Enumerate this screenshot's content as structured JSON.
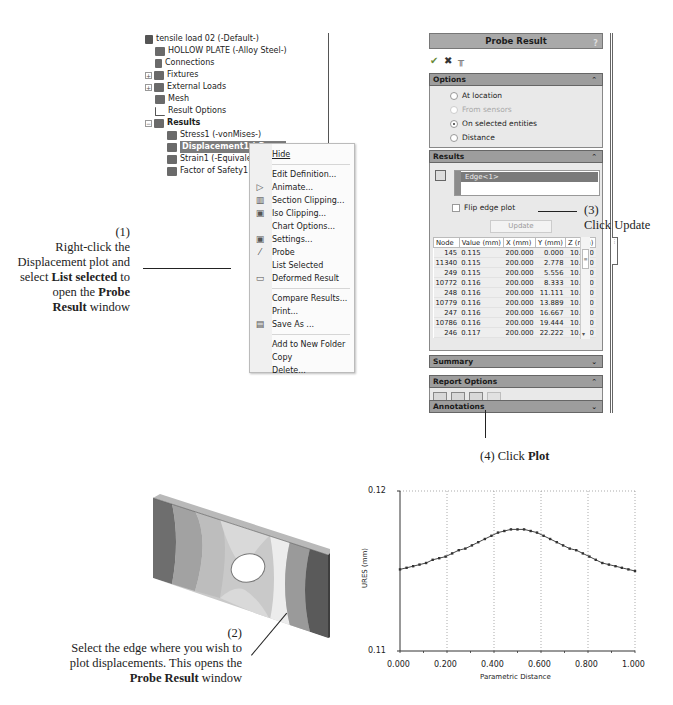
{
  "feature_tree": {
    "root": "tensile load 02 (-Default-)",
    "items": [
      {
        "label": "HOLLOW PLATE (-Alloy Steel-)",
        "icon": "part-icon"
      },
      {
        "label": "Connections",
        "icon": "connections-icon"
      },
      {
        "label": "Fixtures",
        "icon": "fixtures-icon",
        "expandable": true
      },
      {
        "label": "External Loads",
        "icon": "external-loads-icon",
        "expandable": true
      },
      {
        "label": "Mesh",
        "icon": "mesh-icon"
      },
      {
        "label": "Result Options",
        "icon": "result-options-icon"
      },
      {
        "label": "Results",
        "icon": "results-folder-icon",
        "expandable": true
      }
    ],
    "results": [
      {
        "label": "Stress1 (-vonMises-)"
      },
      {
        "label": "Displacement1 (-Res...",
        "selected": true
      },
      {
        "label": "Strain1 (-Equivalent-"
      },
      {
        "label": "Factor of Safety1 (-M"
      }
    ]
  },
  "context_menu": {
    "groups": [
      [
        {
          "label": "Hide"
        }
      ],
      [
        {
          "label": "Edit Definition..."
        },
        {
          "label": "Animate...",
          "icon": "animate-icon"
        },
        {
          "label": "Section Clipping...",
          "icon": "section-clipping-icon"
        },
        {
          "label": "Iso Clipping...",
          "icon": "iso-clipping-icon"
        },
        {
          "label": "Chart Options..."
        },
        {
          "label": "Settings...",
          "icon": "settings-icon"
        },
        {
          "label": "Probe",
          "icon": "probe-icon"
        },
        {
          "label": "List Selected"
        },
        {
          "label": "Deformed Result",
          "icon": "deformed-result-icon"
        }
      ],
      [
        {
          "label": "Compare Results..."
        },
        {
          "label": "Print..."
        },
        {
          "label": "Save As ...",
          "icon": "save-as-icon"
        }
      ],
      [
        {
          "label": "Add to New Folder"
        },
        {
          "label": "Copy"
        },
        {
          "label": "Delete..."
        }
      ]
    ]
  },
  "probe_panel": {
    "title": "Probe Result",
    "help": "?",
    "toolbar": {
      "ok": "✔",
      "cancel": "✖",
      "pin": "╥"
    },
    "options": {
      "header": "Options",
      "radios": [
        {
          "label": "At location",
          "checked": false,
          "disabled": false
        },
        {
          "label": "From sensors",
          "checked": false,
          "disabled": true
        },
        {
          "label": "On selected entities",
          "checked": true,
          "disabled": false
        },
        {
          "label": "Distance",
          "checked": false,
          "disabled": false
        }
      ]
    },
    "results": {
      "header": "Results",
      "selection": "Edge<1>",
      "flip_label": "Flip edge plot",
      "update_label": "Update",
      "columns": [
        "Node",
        "Value (mm)",
        "X (mm)",
        "Y (mm)",
        "Z (mm)"
      ],
      "rows": [
        [
          "145",
          "0.115",
          "200.000",
          "0.000",
          "10.000"
        ],
        [
          "11340",
          "0.115",
          "200.000",
          "2.778",
          "10.000"
        ],
        [
          "249",
          "0.115",
          "200.000",
          "5.556",
          "10.000"
        ],
        [
          "10772",
          "0.116",
          "200.000",
          "8.333",
          "10.000"
        ],
        [
          "248",
          "0.116",
          "200.000",
          "11.111",
          "10.000"
        ],
        [
          "10779",
          "0.116",
          "200.000",
          "13.889",
          "10.000"
        ],
        [
          "247",
          "0.116",
          "200.000",
          "16.667",
          "10.000"
        ],
        [
          "10786",
          "0.116",
          "200.000",
          "19.444",
          "10.000"
        ],
        [
          "246",
          "0.117",
          "200.000",
          "22.222",
          "10.000"
        ]
      ]
    },
    "summary": {
      "header": "Summary"
    },
    "report_options": {
      "header": "Report Options",
      "icons": [
        "save-as-sensor-icon",
        "save-icon",
        "plot-icon",
        "report-icon"
      ]
    },
    "annotations": {
      "header": "Annotations"
    }
  },
  "callouts": {
    "step1": {
      "num": "(1)",
      "line1": "Right-click the",
      "line2": "Displacement plot and",
      "line3a": "select ",
      "line3b": "List selected",
      "line3c": " to",
      "line4a": "open the ",
      "line4b": "Probe",
      "line5a": "Result",
      "line5b": " window"
    },
    "step2": {
      "num": "(2)",
      "line1": "Select the edge where you wish to",
      "line2": "plot displacements. This opens the",
      "line3a": "Probe Result",
      "line3b": " window"
    },
    "step3": {
      "num": "(3)",
      "line1": "Click Update"
    },
    "step4": {
      "prefix": "(4)  Click ",
      "bold": "Plot"
    }
  },
  "chart_data": {
    "type": "line",
    "title": "",
    "xlabel": "Parametric Distance",
    "ylabel": "URES (mm)",
    "xlim": [
      0,
      1
    ],
    "ylim": [
      0.11,
      0.12
    ],
    "x_ticks": [
      "0.000",
      "0.200",
      "0.400",
      "0.600",
      "0.800",
      "1.000"
    ],
    "y_ticks": [
      "0.11",
      "0.12"
    ],
    "grid": "dotted vertical at 0.2 intervals, dotted top border",
    "x": [
      0.0,
      0.028,
      0.056,
      0.083,
      0.111,
      0.139,
      0.167,
      0.194,
      0.222,
      0.25,
      0.278,
      0.306,
      0.333,
      0.361,
      0.389,
      0.417,
      0.444,
      0.472,
      0.5,
      0.528,
      0.556,
      0.583,
      0.611,
      0.639,
      0.667,
      0.694,
      0.722,
      0.75,
      0.778,
      0.806,
      0.833,
      0.861,
      0.889,
      0.917,
      0.944,
      0.972,
      1.0
    ],
    "values": [
      0.1151,
      0.1152,
      0.1153,
      0.1154,
      0.1155,
      0.1157,
      0.1158,
      0.1159,
      0.1161,
      0.1163,
      0.1164,
      0.1166,
      0.1168,
      0.117,
      0.1172,
      0.1174,
      0.1175,
      0.1176,
      0.1176,
      0.1176,
      0.1175,
      0.1174,
      0.1172,
      0.117,
      0.1168,
      0.1166,
      0.1164,
      0.1163,
      0.1161,
      0.1159,
      0.1157,
      0.1155,
      0.1154,
      0.1153,
      0.1152,
      0.1151,
      0.115
    ]
  }
}
